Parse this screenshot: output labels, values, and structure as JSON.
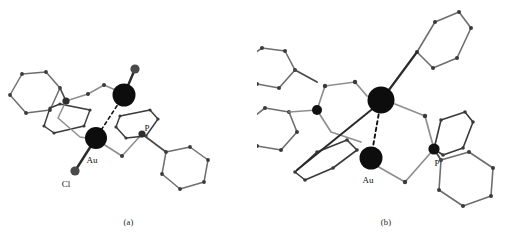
{
  "figure": {
    "background_color": "#ffffff",
    "width": 515,
    "height": 239
  },
  "colors": {
    "metal_sphere": "#0d0d0d",
    "halide_sphere": "#4a4a4a",
    "phosphorus_sphere": "#111111",
    "bond_dark": "#2b2b2b",
    "bond_light": "#8f8f8f",
    "ring_vertex": "#3a3a3a",
    "dashed_contact": "#111111",
    "label_text": "#111111"
  },
  "panels": [
    {
      "id": "a",
      "caption": "(a)",
      "view": "side-on view of dinuclear gold complex",
      "atom_labels": [
        {
          "text": "Au",
          "element": "gold"
        },
        {
          "text": "Cl",
          "element": "chlorine"
        },
        {
          "text": "P",
          "element": "phosphorus"
        }
      ],
      "spheres": [
        {
          "name": "gold-atom-1",
          "element": "Au",
          "cx": 124,
          "cy": 95,
          "r": 11.5,
          "fill": "#0d0d0d"
        },
        {
          "name": "gold-atom-2",
          "element": "Au",
          "cx": 96,
          "cy": 138,
          "r": 11.0,
          "fill": "#0d0d0d"
        },
        {
          "name": "chloride-atom-top",
          "element": "Cl",
          "cx": 135,
          "cy": 69,
          "r": 4.6,
          "fill": "#4a4a4a"
        },
        {
          "name": "chloride-atom-bottom",
          "element": "Cl",
          "cx": 75,
          "cy": 171,
          "r": 4.6,
          "fill": "#4a4a4a"
        },
        {
          "name": "phosphorus-atom-left",
          "element": "P",
          "cx": 66,
          "cy": 101,
          "r": 3.6,
          "fill": "#2e2e2e"
        },
        {
          "name": "phosphorus-atom-right",
          "element": "P",
          "cx": 142,
          "cy": 134,
          "r": 3.6,
          "fill": "#2e2e2e"
        }
      ],
      "contacts": [
        {
          "name": "aurophilic-contact",
          "from": "gold-atom-1",
          "to": "gold-atom-2",
          "style": "dashed"
        }
      ]
    },
    {
      "id": "b",
      "caption": "(b)",
      "view": "end-on view of dinuclear gold complex",
      "atom_labels": [
        {
          "text": "Au",
          "element": "gold"
        },
        {
          "text": "P",
          "element": "phosphorus"
        }
      ],
      "spheres": [
        {
          "name": "gold-atom-1",
          "element": "Au",
          "cx": 381,
          "cy": 100,
          "r": 13.5,
          "fill": "#0d0d0d"
        },
        {
          "name": "gold-atom-2",
          "element": "Au",
          "cx": 371,
          "cy": 158,
          "r": 11.5,
          "fill": "#0d0d0d"
        },
        {
          "name": "phosphorus-atom-left",
          "element": "P",
          "cx": 317,
          "cy": 110,
          "r": 5.0,
          "fill": "#111111"
        },
        {
          "name": "phosphorus-atom-right",
          "element": "P",
          "cx": 434,
          "cy": 149,
          "r": 5.6,
          "fill": "#111111"
        }
      ],
      "contacts": [
        {
          "name": "aurophilic-contact",
          "from": "gold-atom-1",
          "to": "gold-atom-2",
          "style": "dashed"
        }
      ]
    }
  ]
}
